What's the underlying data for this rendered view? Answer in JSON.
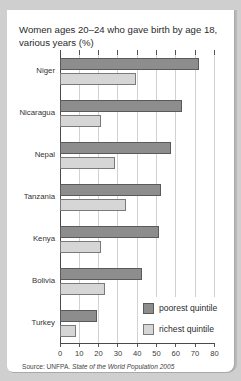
{
  "chart_data": {
    "type": "bar",
    "orientation": "horizontal",
    "title": "Women ages 20–24 who gave birth by age 18, various years (%)",
    "categories": [
      "Niger",
      "Nicaragua",
      "Nepal",
      "Tanzania",
      "Kenya",
      "Bolivia",
      "Turkey"
    ],
    "series": [
      {
        "name": "poorest quintile",
        "color": "#8d8d8d",
        "values": [
          72,
          63,
          57,
          52,
          51,
          42,
          19
        ]
      },
      {
        "name": "richest quintile",
        "color": "#d6d6d6",
        "values": [
          39,
          21,
          28,
          34,
          21,
          23,
          8
        ]
      }
    ],
    "xlabel": "",
    "ylabel": "",
    "xlim": [
      0,
      80
    ],
    "xticks": [
      0,
      10,
      20,
      30,
      40,
      50,
      60,
      70,
      80
    ],
    "grid": true,
    "legend_position": "lower right"
  },
  "title_line1": "Women ages 20–24 who gave birth by age 18,",
  "title_line2": "various years (%)",
  "legend": {
    "poor": "poorest quintile",
    "rich": "richest quintile"
  },
  "source": {
    "prefix": "Source: UNFPA. ",
    "title": "State of the World Population 2005"
  }
}
